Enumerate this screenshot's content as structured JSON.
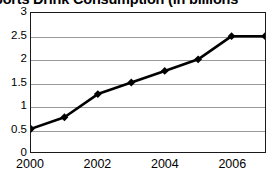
{
  "chart_data": {
    "type": "line",
    "title_visible_text": "ports Drink Consumption (in billions",
    "title_clipped": "true",
    "xlabel": "",
    "ylabel": "",
    "x": [
      2000,
      2001,
      2002,
      2003,
      2004,
      2005,
      2006,
      2007
    ],
    "values": [
      0.5,
      0.75,
      1.25,
      1.5,
      1.75,
      2.0,
      2.5,
      2.5
    ],
    "xlim": [
      2000,
      2007
    ],
    "ylim": [
      0,
      3
    ],
    "yticks": [
      "0",
      "0.5",
      "1",
      "1.5",
      "2",
      "2.5",
      "3"
    ],
    "ytick_values": [
      0,
      0.5,
      1,
      1.5,
      2,
      2.5,
      3
    ],
    "xticks": [
      "2000",
      "2002",
      "2004",
      "2006"
    ],
    "xtick_values": [
      2000,
      2002,
      2004,
      2006
    ],
    "grid": "horizontal",
    "legend": "none",
    "series_color": "#000000",
    "marker": "diamond",
    "gridline_color": "#9a9a9a",
    "border_color": "#1a1a1a",
    "background": "#ffffff"
  }
}
